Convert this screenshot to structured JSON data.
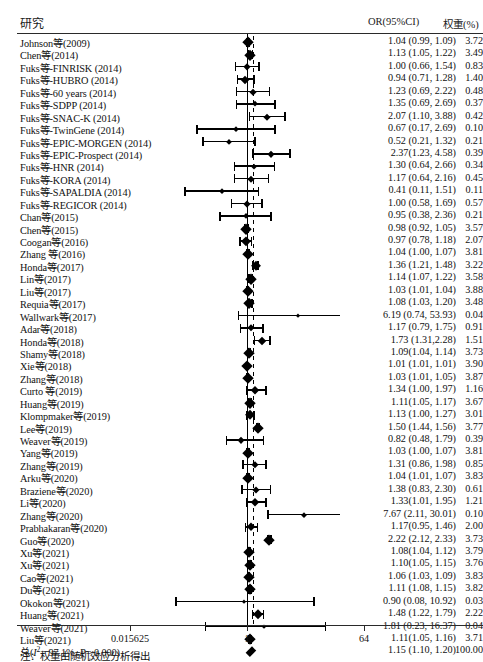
{
  "header": {
    "study_label": "研究",
    "or_label": "OR(95%CI)",
    "weight_label": "权重(%)"
  },
  "note": "注：权重由随机效应分析得出",
  "axis": {
    "ticks": [
      "0.015625",
      "1",
      "64"
    ],
    "tick_values": [
      0.015625,
      1,
      64
    ],
    "scale": "log2",
    "null_line": 1
  },
  "total": {
    "label_prefix": "总(",
    "i2_label": "I",
    "i2_sup": "2",
    "i2_text": "= 97.1%, ",
    "p_label": "P",
    "p_text": "= 0.000)",
    "estimate": "1.15 (1.10, 1.20)",
    "weight": "100.00",
    "or": 1.15,
    "lcl": 1.1,
    "ucl": 1.2
  },
  "chart_data": {
    "type": "forest",
    "title": "",
    "xlabel": "",
    "ylabel": "",
    "xscale": "log2",
    "xlim": [
      0.015625,
      64
    ],
    "xticks": [
      0.015625,
      1,
      64
    ],
    "xticklabels": [
      "0.015625",
      "1",
      "64"
    ],
    "grid": false,
    "null_line": 1,
    "pooled_line": 1.15,
    "columns": [
      "研究",
      "OR(95%CI)",
      "权重(%)"
    ],
    "heterogeneity": {
      "I2": 97.1,
      "P": 0.0
    },
    "pooled": {
      "or": 1.15,
      "lcl": 1.1,
      "ucl": 1.2,
      "weight": 100.0,
      "label": "1.15 (1.10, 1.20)"
    },
    "rows": [
      {
        "study": "Johnson等(2009)",
        "estimate": "1.04 (0.99, 1.09)",
        "weight": "3.72",
        "or": 1.04,
        "lcl": 0.99,
        "ucl": 1.09
      },
      {
        "study": "Chen等(2014)",
        "estimate": "1.13 (1.05, 1.22)",
        "weight": "3.49",
        "or": 1.13,
        "lcl": 1.05,
        "ucl": 1.22
      },
      {
        "study": "Fuks等-FINRISK (2014)",
        "estimate": "1.00 (0.66, 1.54)",
        "weight": "0.83",
        "or": 1.0,
        "lcl": 0.66,
        "ucl": 1.54
      },
      {
        "study": "Fuks等-HUBRO (2014)",
        "estimate": "0.94 (0.71, 1.28)",
        "weight": "1.40",
        "or": 0.94,
        "lcl": 0.71,
        "ucl": 1.28
      },
      {
        "study": "Fuks等-60 years (2014)",
        "estimate": "1.23 (0.69, 2.22)",
        "weight": "0.48",
        "or": 1.23,
        "lcl": 0.69,
        "ucl": 2.22
      },
      {
        "study": "Fuks等-SDPP (2014)",
        "estimate": "1.35 (0.69, 2.69)",
        "weight": "0.37",
        "or": 1.35,
        "lcl": 0.69,
        "ucl": 2.69
      },
      {
        "study": "Fuks等-SNAC-K (2014)",
        "estimate": "2.07 (1.10, 3.88)",
        "weight": "0.42",
        "or": 2.07,
        "lcl": 1.1,
        "ucl": 3.88
      },
      {
        "study": "Fuks等-TwinGene (2014)",
        "estimate": "0.67 (0.17, 2.69)",
        "weight": "0.10",
        "or": 0.67,
        "lcl": 0.17,
        "ucl": 2.69
      },
      {
        "study": "Fuks等-EPIC-MORGEN (2014)",
        "estimate": "0.52 (0.21, 1.32)",
        "weight": "0.21",
        "or": 0.52,
        "lcl": 0.21,
        "ucl": 1.32
      },
      {
        "study": "Fuks等-EPIC-Prospect (2014)",
        "estimate": "2.37(1.23, 4.58)",
        "weight": "0.39",
        "or": 2.37,
        "lcl": 1.23,
        "ucl": 4.58
      },
      {
        "study": "Fuks等-HNR (2014)",
        "estimate": "1.30 (0.64, 2.66)",
        "weight": "0.34",
        "or": 1.3,
        "lcl": 0.64,
        "ucl": 2.66
      },
      {
        "study": "Fuks等-KORA (2014)",
        "estimate": "1.17 (0.64, 2.16)",
        "weight": "0.45",
        "or": 1.17,
        "lcl": 0.64,
        "ucl": 2.16
      },
      {
        "study": "Fuks等-SAPALDIA (2014)",
        "estimate": "0.41 (0.11, 1.51)",
        "weight": "0.11",
        "or": 0.41,
        "lcl": 0.11,
        "ucl": 1.51
      },
      {
        "study": "Fuks等-REGICOR (2014)",
        "estimate": "1.00 (0.58, 1.69)",
        "weight": "0.57",
        "or": 1.0,
        "lcl": 0.58,
        "ucl": 1.69
      },
      {
        "study": "Chan等(2015)",
        "estimate": "0.95 (0.38, 2.36)",
        "weight": "0.21",
        "or": 0.95,
        "lcl": 0.38,
        "ucl": 2.36
      },
      {
        "study": "Chen等(2015)",
        "estimate": "0.98 (0.92, 1.05)",
        "weight": "3.57",
        "or": 0.98,
        "lcl": 0.92,
        "ucl": 1.05
      },
      {
        "study": "Coogan等(2016)",
        "estimate": "0.97 (0.78, 1.18)",
        "weight": "2.07",
        "or": 0.97,
        "lcl": 0.78,
        "ucl": 1.18
      },
      {
        "study": "Zhang 等(2016)",
        "estimate": "1.04 (1.00, 1.07)",
        "weight": "3.81",
        "or": 1.04,
        "lcl": 1.0,
        "ucl": 1.07
      },
      {
        "study": "Honda等(2017)",
        "estimate": "1.36 (1.21, 1.48)",
        "weight": "3.22",
        "or": 1.36,
        "lcl": 1.21,
        "ucl": 1.48
      },
      {
        "study": "Lin等(2017)",
        "estimate": "1.14 (1.07, 1.22)",
        "weight": "3.58",
        "or": 1.14,
        "lcl": 1.07,
        "ucl": 1.22
      },
      {
        "study": "Liu等(2017)",
        "estimate": "1.03 (1.01, 1.04)",
        "weight": "3.88",
        "or": 1.03,
        "lcl": 1.01,
        "ucl": 1.04
      },
      {
        "study": "Requia等(2017)",
        "estimate": "1.08 (1.03, 1.20)",
        "weight": "3.48",
        "or": 1.08,
        "lcl": 1.03,
        "ucl": 1.2
      },
      {
        "study": "Wallwark等(2017)",
        "estimate": "6.19 (0.74, 53.93)",
        "weight": "0.04",
        "or": 6.19,
        "lcl": 0.74,
        "ucl": 53.93
      },
      {
        "study": "Adar等(2018)",
        "estimate": "1.17 (0.79, 1.75)",
        "weight": "0.91",
        "or": 1.17,
        "lcl": 0.79,
        "ucl": 1.75
      },
      {
        "study": "Honda等(2018)",
        "estimate": "1.73 (1.31,2.28)",
        "weight": "1.51",
        "or": 1.73,
        "lcl": 1.31,
        "ucl": 2.28
      },
      {
        "study": "Shamy等(2018)",
        "estimate": "1.09(1.04, 1.14)",
        "weight": "3.73",
        "or": 1.09,
        "lcl": 1.04,
        "ucl": 1.14
      },
      {
        "study": "Xie等(2018)",
        "estimate": "1.01 (1.01, 1.01)",
        "weight": "3.90",
        "or": 1.01,
        "lcl": 1.01,
        "ucl": 1.01
      },
      {
        "study": "Zhang等(2018)",
        "estimate": "1.03 (1.01, 1.05)",
        "weight": "3.87",
        "or": 1.03,
        "lcl": 1.01,
        "ucl": 1.05
      },
      {
        "study": "Curto 等(2019)",
        "estimate": "1.34 (1.00, 1.97)",
        "weight": "1.16",
        "or": 1.34,
        "lcl": 1.0,
        "ucl": 1.97
      },
      {
        "study": "Huang等(2019)",
        "estimate": "1.11(1.05, 1.17)",
        "weight": "3.67",
        "or": 1.11,
        "lcl": 1.05,
        "ucl": 1.17
      },
      {
        "study": "Klompmaker等(2019)",
        "estimate": "1.13 (1.00, 1.27)",
        "weight": "3.01",
        "or": 1.13,
        "lcl": 1.0,
        "ucl": 1.27
      },
      {
        "study": "Lee等(2019)",
        "estimate": "1.50 (1.44, 1.56)",
        "weight": "3.77",
        "or": 1.5,
        "lcl": 1.44,
        "ucl": 1.56
      },
      {
        "study": "Weaver等(2019)",
        "estimate": "0.82 (0.48, 1.79)",
        "weight": "0.39",
        "or": 0.82,
        "lcl": 0.48,
        "ucl": 1.79
      },
      {
        "study": "Yang等(2019)",
        "estimate": "1.03 (1.00, 1.07)",
        "weight": "3.81",
        "or": 1.03,
        "lcl": 1.0,
        "ucl": 1.07
      },
      {
        "study": "Zhang等(2019)",
        "estimate": "1.31 (0.86, 1.98)",
        "weight": "0.85",
        "or": 1.31,
        "lcl": 0.86,
        "ucl": 1.98
      },
      {
        "study": "Arku等(2020)",
        "estimate": "1.04 (1.01, 1.07)",
        "weight": "3.83",
        "or": 1.04,
        "lcl": 1.01,
        "ucl": 1.07
      },
      {
        "study": "Braziene等(2020)",
        "estimate": "1.38 (0.83, 2.30)",
        "weight": "0.61",
        "or": 1.38,
        "lcl": 0.83,
        "ucl": 2.3
      },
      {
        "study": "Li等(2020)",
        "estimate": "1.33(1.01, 1.95)",
        "weight": "1.21",
        "or": 1.33,
        "lcl": 1.01,
        "ucl": 1.95
      },
      {
        "study": "Zhang等(2020)",
        "estimate": "7.67 (2.11, 30.01)",
        "weight": "0.10",
        "or": 7.67,
        "lcl": 2.11,
        "ucl": 30.01
      },
      {
        "study": "Prabhakaran等(2020)",
        "estimate": "1.17(0.95, 1.46)",
        "weight": "2.00",
        "or": 1.17,
        "lcl": 0.95,
        "ucl": 1.46
      },
      {
        "study": "Guo等(2020)",
        "estimate": "2.22 (2.12, 2.33)",
        "weight": "3.73",
        "or": 2.22,
        "lcl": 2.12,
        "ucl": 2.33
      },
      {
        "study": "Xu等(2021)",
        "estimate": "1.08(1.04, 1.12)",
        "weight": "3.79",
        "or": 1.08,
        "lcl": 1.04,
        "ucl": 1.12
      },
      {
        "study": "Xu等(2021)",
        "estimate": "1.10(1.05, 1.15)",
        "weight": "3.76",
        "or": 1.1,
        "lcl": 1.05,
        "ucl": 1.15
      },
      {
        "study": "Cao等(2021)",
        "estimate": "1.06 (1.03, 1.09)",
        "weight": "3.83",
        "or": 1.06,
        "lcl": 1.03,
        "ucl": 1.09
      },
      {
        "study": "Du等(2021)",
        "estimate": "1.11 (1.08, 1.15)",
        "weight": "3.82",
        "or": 1.11,
        "lcl": 1.08,
        "ucl": 1.15
      },
      {
        "study": "Okokon等(2021)",
        "estimate": "0.90 (0.08, 10.92)",
        "weight": "0.03",
        "or": 0.9,
        "lcl": 0.08,
        "ucl": 10.92
      },
      {
        "study": "Huang等(2021)",
        "estimate": "1.48 (1.22, 1.79)",
        "weight": "2.22",
        "or": 1.48,
        "lcl": 1.22,
        "ucl": 1.79
      },
      {
        "study": "Weaver等(2021)",
        "estimate": "1.81 (0.23, 16.37)",
        "weight": "0.04",
        "or": 1.81,
        "lcl": 0.23,
        "ucl": 16.37
      },
      {
        "study": "Liu等(2021)",
        "estimate": "1.11(1.05, 1.16)",
        "weight": "3.71",
        "or": 1.11,
        "lcl": 1.05,
        "ucl": 1.16
      }
    ]
  }
}
